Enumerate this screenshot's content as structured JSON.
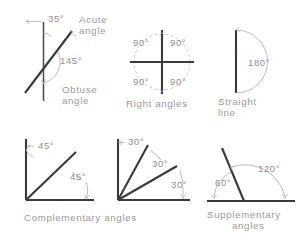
{
  "figure": {
    "background_color": "#ffffff",
    "line_color": "#3a3a3a",
    "arc_color": "#b6b6b6",
    "text_color": "#8e8e8e"
  },
  "panels": [
    {
      "id": "acute-obtuse",
      "caption_lines": [
        "Acute",
        "angle"
      ],
      "caption2_lines": [
        "Obtuse",
        "angle"
      ],
      "angles": [
        {
          "label": "35°",
          "value": 35
        },
        {
          "label": "145°",
          "value": 145
        }
      ]
    },
    {
      "id": "right-angles",
      "caption_lines": [
        "Right angles"
      ],
      "angles": [
        {
          "label": "90°",
          "value": 90
        },
        {
          "label": "90°",
          "value": 90
        },
        {
          "label": "90°",
          "value": 90
        },
        {
          "label": "90°",
          "value": 90
        }
      ]
    },
    {
      "id": "straight-line",
      "caption_lines": [
        "Straight",
        "line"
      ],
      "angles": [
        {
          "label": "180°",
          "value": 180
        }
      ]
    },
    {
      "id": "complementary",
      "caption_lines": [
        "Complementary",
        "angles"
      ],
      "angles": [
        {
          "label": "45°",
          "value": 45
        },
        {
          "label": "45°",
          "value": 45
        }
      ]
    },
    {
      "id": "complementary-thirds",
      "caption_lines": [],
      "angles": [
        {
          "label": "30°",
          "value": 30
        },
        {
          "label": "30°",
          "value": 30
        },
        {
          "label": "30°",
          "value": 30
        }
      ]
    },
    {
      "id": "supplementary",
      "caption_lines": [
        "Supplementary",
        "angles"
      ],
      "angles": [
        {
          "label": "60°",
          "value": 60
        },
        {
          "label": "120°",
          "value": 120
        }
      ]
    }
  ],
  "labels": {
    "acute_35": "35°",
    "acute_word_1": "Acute",
    "acute_word_2": "angle",
    "obtuse_145": "145°",
    "obtuse_word_1": "Obtuse",
    "obtuse_word_2": "angle",
    "right_90_tl": "90°",
    "right_90_tr": "90°",
    "right_90_bl": "90°",
    "right_90_br": "90°",
    "right_caption": "Right  angles",
    "straight_180": "180°",
    "straight_word_1": "Straight",
    "straight_word_2": "line",
    "comp_45_top": "45°",
    "comp_45_bottom": "45°",
    "comp_caption": "Complementary  angles",
    "thirds_30_a": "30°",
    "thirds_30_b": "30°",
    "thirds_30_c": "30°",
    "supp_60": "60°",
    "supp_120": "120°",
    "supp_word_1": "Supplementary",
    "supp_word_2": "angles"
  }
}
